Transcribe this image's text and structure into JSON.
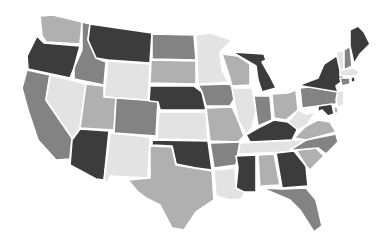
{
  "map": {
    "title": "",
    "type": "choropleth",
    "region": "United States (contiguous)",
    "palette": {
      "darkest": "#3c3c3c",
      "dark": "#838383",
      "medium": "#b0b0b0",
      "light": "#e3e3e3",
      "border": "#ffffff",
      "background": "#ffffff"
    },
    "states": [
      {
        "code": "WA",
        "shade": "medium"
      },
      {
        "code": "OR",
        "shade": "darkest"
      },
      {
        "code": "CA",
        "shade": "dark"
      },
      {
        "code": "NV",
        "shade": "light"
      },
      {
        "code": "ID",
        "shade": "dark"
      },
      {
        "code": "MT",
        "shade": "darkest"
      },
      {
        "code": "WY",
        "shade": "light"
      },
      {
        "code": "UT",
        "shade": "medium"
      },
      {
        "code": "AZ",
        "shade": "darkest"
      },
      {
        "code": "CO",
        "shade": "dark"
      },
      {
        "code": "NM",
        "shade": "light"
      },
      {
        "code": "ND",
        "shade": "dark"
      },
      {
        "code": "SD",
        "shade": "medium"
      },
      {
        "code": "NE",
        "shade": "darkest"
      },
      {
        "code": "KS",
        "shade": "light"
      },
      {
        "code": "OK",
        "shade": "darkest"
      },
      {
        "code": "TX",
        "shade": "medium"
      },
      {
        "code": "MN",
        "shade": "light"
      },
      {
        "code": "IA",
        "shade": "dark"
      },
      {
        "code": "MO",
        "shade": "medium"
      },
      {
        "code": "AR",
        "shade": "dark"
      },
      {
        "code": "LA",
        "shade": "light"
      },
      {
        "code": "WI",
        "shade": "medium"
      },
      {
        "code": "IL",
        "shade": "light"
      },
      {
        "code": "MI",
        "shade": "darkest"
      },
      {
        "code": "IN",
        "shade": "dark"
      },
      {
        "code": "OH",
        "shade": "medium"
      },
      {
        "code": "KY",
        "shade": "darkest"
      },
      {
        "code": "TN",
        "shade": "light"
      },
      {
        "code": "MS",
        "shade": "darkest"
      },
      {
        "code": "AL",
        "shade": "medium"
      },
      {
        "code": "GA",
        "shade": "darkest"
      },
      {
        "code": "FL",
        "shade": "dark"
      },
      {
        "code": "SC",
        "shade": "medium"
      },
      {
        "code": "NC",
        "shade": "dark"
      },
      {
        "code": "VA",
        "shade": "medium"
      },
      {
        "code": "WV",
        "shade": "light"
      },
      {
        "code": "PA",
        "shade": "dark"
      },
      {
        "code": "NY",
        "shade": "darkest"
      },
      {
        "code": "NJ",
        "shade": "light"
      },
      {
        "code": "DE",
        "shade": "medium"
      },
      {
        "code": "MD",
        "shade": "darkest"
      },
      {
        "code": "VT",
        "shade": "light"
      },
      {
        "code": "NH",
        "shade": "dark"
      },
      {
        "code": "ME",
        "shade": "darkest"
      },
      {
        "code": "MA",
        "shade": "light"
      },
      {
        "code": "CT",
        "shade": "dark"
      },
      {
        "code": "RI",
        "shade": "darkest"
      }
    ]
  }
}
